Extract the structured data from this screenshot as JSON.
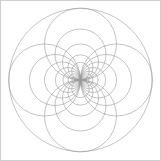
{
  "figure": {
    "width": 161,
    "height": 161,
    "background_color": "#ffffff",
    "border_color": "#cfcfcf",
    "stroke_color": "#9a9a9a",
    "stroke_width": 0.6,
    "fill": "none"
  },
  "chart_data": {
    "type": "scatter",
    "subtitle": "",
    "xlabel": "",
    "ylabel": "",
    "xlim": [
      0,
      161
    ],
    "ylim": [
      0,
      161
    ],
    "grid": false,
    "legend": "none",
    "tangency_point": [
      80.5,
      80.0
    ],
    "annotations": [],
    "series": [
      {
        "name": "outer-circle",
        "role": "boundary",
        "stroke": "#9a9a9a",
        "circles": [
          {
            "cx": 80.5,
            "cy": 80.0,
            "r": 71.5
          }
        ]
      },
      {
        "name": "right-tangent-family",
        "role": "pencil",
        "stroke": "#9a9a9a",
        "ratio": 0.702,
        "circles": [
          {
            "cx": 116.5,
            "cy": 80.0,
            "r": 36.0
          },
          {
            "cx": 106.0,
            "cy": 80.0,
            "r": 25.5
          },
          {
            "cx": 98.5,
            "cy": 80.0,
            "r": 18.0
          },
          {
            "cx": 93.1,
            "cy": 80.0,
            "r": 12.6
          },
          {
            "cx": 89.3,
            "cy": 80.0,
            "r": 8.8
          },
          {
            "cx": 86.7,
            "cy": 80.0,
            "r": 6.2
          },
          {
            "cx": 84.8,
            "cy": 80.0,
            "r": 4.3
          },
          {
            "cx": 83.5,
            "cy": 80.0,
            "r": 3.0
          },
          {
            "cx": 82.6,
            "cy": 80.0,
            "r": 2.1
          },
          {
            "cx": 82.0,
            "cy": 80.0,
            "r": 1.5
          }
        ]
      },
      {
        "name": "left-tangent-family",
        "role": "pencil",
        "stroke": "#9a9a9a",
        "ratio": 0.702,
        "circles": [
          {
            "cx": 44.5,
            "cy": 80.0,
            "r": 36.0
          },
          {
            "cx": 55.0,
            "cy": 80.0,
            "r": 25.5
          },
          {
            "cx": 62.5,
            "cy": 80.0,
            "r": 18.0
          },
          {
            "cx": 67.9,
            "cy": 80.0,
            "r": 12.6
          },
          {
            "cx": 71.7,
            "cy": 80.0,
            "r": 8.8
          },
          {
            "cx": 74.3,
            "cy": 80.0,
            "r": 6.2
          },
          {
            "cx": 76.2,
            "cy": 80.0,
            "r": 4.3
          },
          {
            "cx": 77.5,
            "cy": 80.0,
            "r": 3.0
          },
          {
            "cx": 78.4,
            "cy": 80.0,
            "r": 2.1
          },
          {
            "cx": 79.0,
            "cy": 80.0,
            "r": 1.5
          }
        ]
      },
      {
        "name": "orthogonal-arc-family",
        "role": "orthogonal",
        "stroke": "#9a9a9a",
        "circles": [
          {
            "cx": 80.5,
            "cy": 44.0,
            "r": 36.0
          },
          {
            "cx": 80.5,
            "cy": 116.0,
            "r": 36.0
          },
          {
            "cx": 80.5,
            "cy": 54.5,
            "r": 25.5
          },
          {
            "cx": 80.5,
            "cy": 105.5,
            "r": 25.5
          },
          {
            "cx": 80.5,
            "cy": 62.0,
            "r": 18.0
          },
          {
            "cx": 80.5,
            "cy": 98.0,
            "r": 18.0
          },
          {
            "cx": 80.5,
            "cy": 67.4,
            "r": 12.6
          },
          {
            "cx": 80.5,
            "cy": 92.6,
            "r": 12.6
          },
          {
            "cx": 80.5,
            "cy": 71.2,
            "r": 8.8
          },
          {
            "cx": 80.5,
            "cy": 88.8,
            "r": 8.8
          }
        ]
      }
    ]
  }
}
